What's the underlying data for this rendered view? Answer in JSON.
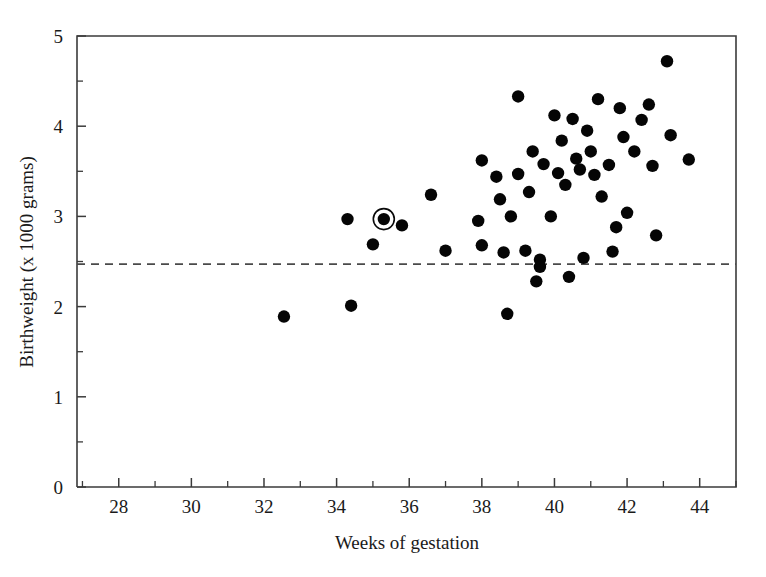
{
  "chart_data": {
    "type": "scatter",
    "title": "",
    "xlabel": "Weeks of gestation",
    "ylabel": "Birthweight (x 1000 grams)",
    "xlim": [
      26.85,
      45.0
    ],
    "ylim": [
      0,
      5
    ],
    "xticks": [
      28,
      30,
      32,
      34,
      36,
      38,
      40,
      42,
      44
    ],
    "xtick_labels": [
      "28",
      "30",
      "32",
      "34",
      "36",
      "38",
      "40",
      "42",
      "44"
    ],
    "xticks_minor": [
      27,
      29,
      31,
      33,
      35,
      37,
      39,
      41,
      43,
      45
    ],
    "yticks": [
      0,
      1,
      2,
      3,
      4,
      5
    ],
    "ytick_labels": [
      "0",
      "1",
      "2",
      "3",
      "4",
      "5"
    ],
    "yticks_minor": [
      0.5,
      1.5,
      2.5,
      3.5,
      4.5
    ],
    "grid": false,
    "legend": null,
    "annotations": [
      {
        "kind": "horizontal-dashed-line",
        "name": "low-birthweight-threshold",
        "y": 2.47,
        "label": ""
      },
      {
        "kind": "circled-point",
        "name": "highlighted-observation",
        "x": 35.3,
        "y": 2.97
      }
    ],
    "points": [
      {
        "x": 32.55,
        "y": 1.89
      },
      {
        "x": 34.3,
        "y": 2.97
      },
      {
        "x": 34.4,
        "y": 2.01
      },
      {
        "x": 35.0,
        "y": 2.69
      },
      {
        "x": 35.3,
        "y": 2.97
      },
      {
        "x": 35.8,
        "y": 2.9
      },
      {
        "x": 36.6,
        "y": 3.24
      },
      {
        "x": 37.0,
        "y": 2.62
      },
      {
        "x": 37.9,
        "y": 2.95
      },
      {
        "x": 38.0,
        "y": 2.68
      },
      {
        "x": 38.0,
        "y": 3.62
      },
      {
        "x": 38.4,
        "y": 3.44
      },
      {
        "x": 38.5,
        "y": 3.19
      },
      {
        "x": 38.6,
        "y": 2.6
      },
      {
        "x": 38.7,
        "y": 1.92
      },
      {
        "x": 38.8,
        "y": 3.0
      },
      {
        "x": 39.0,
        "y": 3.47
      },
      {
        "x": 39.0,
        "y": 4.33
      },
      {
        "x": 39.2,
        "y": 2.62
      },
      {
        "x": 39.3,
        "y": 3.27
      },
      {
        "x": 39.4,
        "y": 3.72
      },
      {
        "x": 39.5,
        "y": 2.28
      },
      {
        "x": 39.6,
        "y": 2.52
      },
      {
        "x": 39.6,
        "y": 2.44
      },
      {
        "x": 39.7,
        "y": 3.58
      },
      {
        "x": 39.9,
        "y": 3.0
      },
      {
        "x": 40.0,
        "y": 4.12
      },
      {
        "x": 40.1,
        "y": 3.48
      },
      {
        "x": 40.2,
        "y": 3.84
      },
      {
        "x": 40.3,
        "y": 3.35
      },
      {
        "x": 40.4,
        "y": 2.33
      },
      {
        "x": 40.5,
        "y": 4.08
      },
      {
        "x": 40.6,
        "y": 3.64
      },
      {
        "x": 40.7,
        "y": 3.52
      },
      {
        "x": 40.8,
        "y": 2.54
      },
      {
        "x": 40.9,
        "y": 3.95
      },
      {
        "x": 41.0,
        "y": 3.72
      },
      {
        "x": 41.1,
        "y": 3.46
      },
      {
        "x": 41.2,
        "y": 4.3
      },
      {
        "x": 41.3,
        "y": 3.22
      },
      {
        "x": 41.5,
        "y": 3.57
      },
      {
        "x": 41.6,
        "y": 2.61
      },
      {
        "x": 41.7,
        "y": 2.88
      },
      {
        "x": 41.8,
        "y": 4.2
      },
      {
        "x": 41.9,
        "y": 3.88
      },
      {
        "x": 42.0,
        "y": 3.04
      },
      {
        "x": 42.2,
        "y": 3.72
      },
      {
        "x": 42.4,
        "y": 4.07
      },
      {
        "x": 42.6,
        "y": 4.24
      },
      {
        "x": 42.7,
        "y": 3.56
      },
      {
        "x": 42.8,
        "y": 2.79
      },
      {
        "x": 43.1,
        "y": 4.72
      },
      {
        "x": 43.2,
        "y": 3.9
      },
      {
        "x": 43.7,
        "y": 3.63
      }
    ]
  },
  "figure": {
    "background_color": "#ffffff",
    "point_color": "#050505",
    "axis_color": "#3b3b3b",
    "threshold_color": "#4a4a4a"
  }
}
